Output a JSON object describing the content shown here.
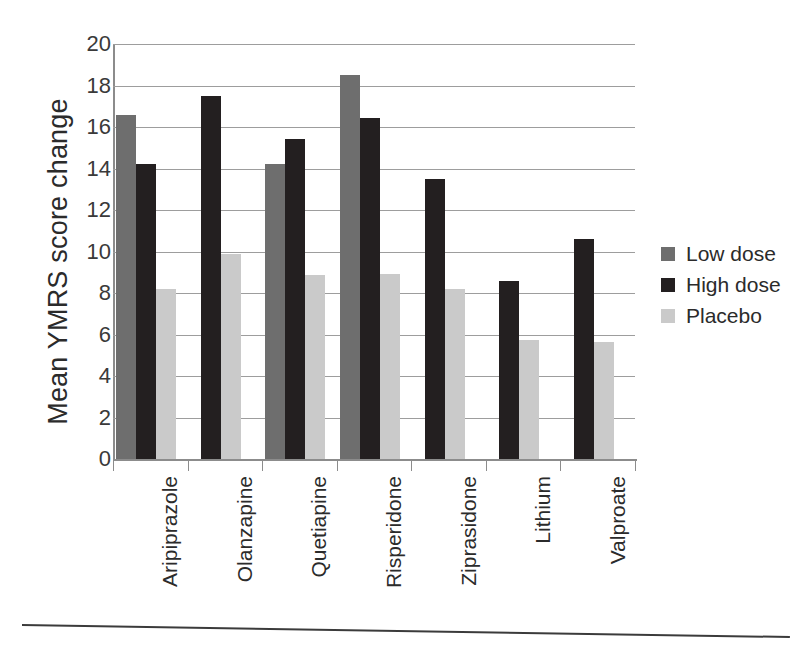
{
  "chart_data": {
    "type": "bar",
    "title": "",
    "xlabel": "",
    "ylabel": "Mean YMRS score change",
    "ylim": [
      0,
      20
    ],
    "yticks": [
      0,
      2,
      4,
      6,
      8,
      10,
      12,
      14,
      16,
      18,
      20
    ],
    "grid": true,
    "legend_position": "right",
    "categories": [
      "Aripiprazole",
      "Olanzapine",
      "Quetiapine",
      "Risperidone",
      "Ziprasidone",
      "Lithium",
      "Valproate"
    ],
    "series": [
      {
        "name": "Low dose",
        "color": "#6e6e6e",
        "values": [
          16.6,
          null,
          14.2,
          18.5,
          null,
          null,
          null
        ]
      },
      {
        "name": "High dose",
        "color": "#231f20",
        "values": [
          14.2,
          17.5,
          15.4,
          16.45,
          13.5,
          8.6,
          10.6
        ]
      },
      {
        "name": "Placebo",
        "color": "#cacaca",
        "values": [
          8.2,
          9.9,
          8.85,
          8.9,
          8.2,
          5.75,
          5.65
        ]
      }
    ]
  },
  "legend": {
    "items": [
      {
        "label": "Low dose",
        "color": "#6e6e6e"
      },
      {
        "label": "High dose",
        "color": "#231f20"
      },
      {
        "label": "Placebo",
        "color": "#cacaca"
      }
    ]
  },
  "axes": {
    "y_title": "Mean YMRS score change",
    "y_tick_labels": [
      "20",
      "18",
      "16",
      "14",
      "12",
      "10",
      "8",
      "6",
      "4",
      "2",
      "0"
    ],
    "x_tick_labels": [
      "Aripiprazole",
      "Olanzapine",
      "Quetiapine",
      "Risperidone",
      "Ziprasidone",
      "Lithium",
      "Valproate"
    ]
  },
  "colors": {
    "low_dose": "#6e6e6e",
    "high_dose": "#231f20",
    "placebo": "#cacaca",
    "gridline": "#9d9d9d",
    "axis": "#8c8c8c",
    "text": "#2b2b2b",
    "background": "#ffffff"
  }
}
